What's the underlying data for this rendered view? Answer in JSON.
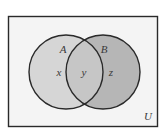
{
  "diagram": {
    "type": "venn",
    "universe": {
      "label": "U",
      "fill": "#f4f4f4",
      "stroke": "#2a2a2a"
    },
    "sets": [
      {
        "name": "A",
        "fill": "#d6d6d6"
      },
      {
        "name": "B",
        "fill": "#b6b6b6"
      }
    ],
    "regions": [
      {
        "id": "A-only",
        "label": "x"
      },
      {
        "id": "A-and-B",
        "label": "y",
        "fill": "#c6c6c6"
      },
      {
        "id": "B-only",
        "label": "z"
      }
    ],
    "stroke_color": "#2a2a2a",
    "background": "#ffffff"
  }
}
